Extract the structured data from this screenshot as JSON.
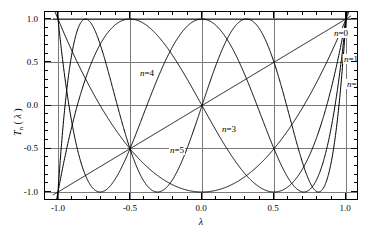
{
  "chart_data": {
    "type": "line",
    "title": "",
    "xlabel": "λ",
    "ylabel": "Tₙ(λ)",
    "ylabel_base": "T",
    "ylabel_sub": "n",
    "ylabel_arg": "(λ)",
    "xlim": [
      -1.0,
      1.0
    ],
    "ylim": [
      -1.0,
      1.0
    ],
    "grid": true,
    "legend_position": "inline-annotations",
    "x_ticks": [
      "-1.0",
      "-0.5",
      "0.0",
      "0.5",
      "1.0"
    ],
    "x_tick_values": [
      -1.0,
      -0.5,
      0.0,
      0.5,
      1.0
    ],
    "y_ticks": [
      "1.0",
      "0.5",
      "0.0",
      "-0.5",
      "-1.0"
    ],
    "y_tick_values": [
      1.0,
      0.5,
      0.0,
      -0.5,
      -1.0
    ],
    "x_minor_count": 4,
    "y_minor_count": 4,
    "series": [
      {
        "name": "n=0",
        "label": "n=0",
        "n": 0,
        "formula": "T0(x) = 1",
        "label_x": 0.68,
        "label_y": 0.92
      },
      {
        "name": "n=1",
        "label": "n=1",
        "n": 1,
        "formula": "T1(x) = x",
        "label_x": 0.77,
        "label_y": 0.62
      },
      {
        "name": "n=2",
        "label": "n=2",
        "n": 2,
        "formula": "T2(x) = 2x^2 - 1",
        "label_x": 0.8,
        "label_y": 0.33
      },
      {
        "name": "n=3",
        "label": "n=3",
        "n": 3,
        "formula": "T3(x) = 4x^3 - 3x",
        "label_x": 0.22,
        "label_y": -0.16
      },
      {
        "name": "n=4",
        "label": "n=4",
        "n": 4,
        "formula": "T4(x) = 8x^4 - 8x^2 + 1",
        "label_x": -0.38,
        "label_y": 0.45
      },
      {
        "name": "n=5",
        "label": "n=5",
        "n": 5,
        "formula": "T5(x) = 16x^5 - 20x^3 + 5x",
        "label_x": -0.15,
        "label_y": -0.38
      }
    ],
    "line_color": "#000000",
    "grid_color": "#7a7a7a",
    "frame_color": "#000000",
    "background": "#ffffff",
    "domain_overshoot": 1.035
  }
}
